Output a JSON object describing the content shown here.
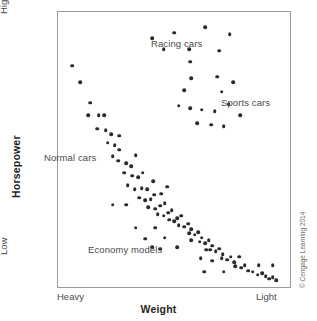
{
  "figure": {
    "credit": "© Cengage Learning 2014",
    "accent_color": "#2b2b2b",
    "frame_color": "#9a9a9a",
    "text_color": "#4a4a4a"
  },
  "axes": {
    "y_title": "Horsepower",
    "y_high_label": "High",
    "y_low_label": "Low",
    "x_title": "Weight",
    "x_left_label": "Heavy",
    "x_right_label": "Light"
  },
  "annotations": [
    {
      "id": "racing",
      "label": "Racing cars"
    },
    {
      "id": "sports",
      "label": "Sports cars"
    },
    {
      "id": "normal",
      "label": "Normal cars"
    },
    {
      "id": "economy",
      "label": "Economy models"
    }
  ],
  "chart_data": {
    "type": "scatter",
    "title": "",
    "xlabel": "Weight",
    "ylabel": "Horsepower",
    "xlim": [
      0,
      100
    ],
    "ylim": [
      0,
      100
    ],
    "x_axis_direction": "Heavy (left) to Light (right)",
    "y_axis_direction": "Low (bottom) to High (top)",
    "grid": false,
    "legend": "none",
    "tick_labels": {
      "x": [
        "Heavy",
        "Light"
      ],
      "y": [
        "Low",
        "High"
      ]
    },
    "annotations": [
      {
        "text": "Racing cars",
        "x": 47,
        "y": 93
      },
      {
        "text": "Sports cars",
        "x": 83,
        "y": 71
      },
      {
        "text": "Normal cars",
        "x": 10,
        "y": 52
      },
      {
        "text": "Economy models",
        "x": 31,
        "y": 19
      }
    ],
    "series": [
      {
        "name": "Normal cars",
        "description": "Dense downward-sloping band from heavy/high-power to light/low-power",
        "points": [
          [
            6.0,
            80.5
          ],
          [
            9.5,
            74.5
          ],
          [
            14.0,
            67.0
          ],
          [
            13.0,
            62.5
          ],
          [
            17.5,
            62.5
          ],
          [
            20.0,
            62.5
          ],
          [
            17.0,
            57.5
          ],
          [
            20.5,
            57.0
          ],
          [
            23.0,
            55.5
          ],
          [
            21.5,
            52.5
          ],
          [
            24.5,
            51.5
          ],
          [
            26.5,
            50.0
          ],
          [
            23.5,
            47.5
          ],
          [
            26.0,
            46.0
          ],
          [
            29.5,
            45.0
          ],
          [
            31.5,
            44.0
          ],
          [
            28.5,
            41.5
          ],
          [
            32.0,
            40.5
          ],
          [
            34.5,
            40.0
          ],
          [
            36.5,
            41.5
          ],
          [
            30.0,
            37.0
          ],
          [
            33.0,
            35.5
          ],
          [
            36.0,
            36.0
          ],
          [
            38.5,
            35.5
          ],
          [
            35.0,
            32.5
          ],
          [
            37.5,
            31.5
          ],
          [
            40.0,
            32.0
          ],
          [
            41.5,
            33.5
          ],
          [
            39.0,
            29.0
          ],
          [
            42.0,
            28.5
          ],
          [
            44.0,
            29.5
          ],
          [
            46.0,
            30.5
          ],
          [
            43.0,
            26.5
          ],
          [
            45.5,
            26.0
          ],
          [
            47.5,
            27.0
          ],
          [
            49.0,
            28.0
          ],
          [
            48.0,
            24.5
          ],
          [
            50.0,
            24.0
          ],
          [
            51.5,
            25.0
          ],
          [
            53.0,
            26.0
          ],
          [
            52.0,
            22.5
          ],
          [
            54.5,
            22.0
          ],
          [
            56.0,
            23.0
          ],
          [
            57.5,
            21.0
          ],
          [
            56.5,
            19.5
          ],
          [
            59.0,
            19.0
          ],
          [
            60.5,
            20.0
          ],
          [
            62.0,
            18.0
          ],
          [
            61.0,
            16.5
          ],
          [
            63.5,
            16.0
          ],
          [
            65.0,
            17.0
          ],
          [
            66.5,
            15.0
          ],
          [
            65.5,
            13.5
          ],
          [
            68.0,
            13.0
          ],
          [
            69.5,
            14.0
          ],
          [
            71.0,
            12.0
          ],
          [
            70.5,
            10.5
          ],
          [
            73.0,
            10.0
          ],
          [
            74.5,
            11.0
          ],
          [
            76.0,
            9.0
          ],
          [
            76.5,
            7.5
          ],
          [
            79.0,
            7.0
          ],
          [
            80.5,
            8.0
          ],
          [
            82.0,
            6.0
          ],
          [
            84.0,
            5.5
          ],
          [
            86.0,
            4.5
          ],
          [
            88.0,
            5.0
          ],
          [
            89.5,
            4.0
          ],
          [
            91.0,
            3.0
          ],
          [
            92.5,
            3.5
          ],
          [
            94.0,
            2.5
          ],
          [
            33.5,
            48.0
          ],
          [
            26.5,
            55.0
          ],
          [
            41.0,
            38.5
          ],
          [
            44.5,
            34.0
          ],
          [
            47.0,
            36.5
          ]
        ]
      },
      {
        "name": "Racing cars",
        "description": "Highest horsepower group, upper middle to upper right",
        "points": [
          [
            40.5,
            90.5
          ],
          [
            50.0,
            92.5
          ],
          [
            63.5,
            94.5
          ],
          [
            74.0,
            92.0
          ],
          [
            45.5,
            86.5
          ],
          [
            56.5,
            86.5
          ],
          [
            69.5,
            86.0
          ],
          [
            57.0,
            82.0
          ]
        ]
      },
      {
        "name": "Sports cars",
        "description": "High horsepower, lighter weight, upper-right region",
        "points": [
          [
            57.5,
            76.0
          ],
          [
            68.5,
            76.5
          ],
          [
            75.5,
            74.5
          ],
          [
            70.5,
            71.0
          ],
          [
            54.5,
            71.5
          ],
          [
            52.0,
            66.0
          ],
          [
            57.0,
            65.0
          ],
          [
            62.0,
            64.5
          ],
          [
            67.5,
            64.0
          ],
          [
            73.5,
            66.5
          ],
          [
            60.0,
            59.5
          ],
          [
            66.0,
            59.0
          ],
          [
            71.5,
            58.5
          ],
          [
            78.5,
            62.5
          ]
        ]
      },
      {
        "name": "Economy models",
        "description": "Low horsepower scattered points across mid and light weights",
        "points": [
          [
            23.5,
            30.0
          ],
          [
            29.5,
            30.0
          ],
          [
            33.5,
            21.5
          ],
          [
            42.0,
            21.5
          ],
          [
            37.5,
            17.5
          ],
          [
            46.0,
            18.0
          ],
          [
            40.5,
            14.5
          ],
          [
            44.0,
            14.0
          ],
          [
            51.5,
            14.5
          ],
          [
            57.5,
            17.0
          ],
          [
            64.0,
            13.5
          ],
          [
            61.5,
            10.5
          ],
          [
            66.5,
            9.5
          ],
          [
            63.0,
            5.5
          ],
          [
            71.5,
            5.5
          ],
          [
            86.5,
            8.0
          ],
          [
            92.5,
            8.0
          ],
          [
            78.0,
            11.0
          ]
        ]
      }
    ]
  }
}
